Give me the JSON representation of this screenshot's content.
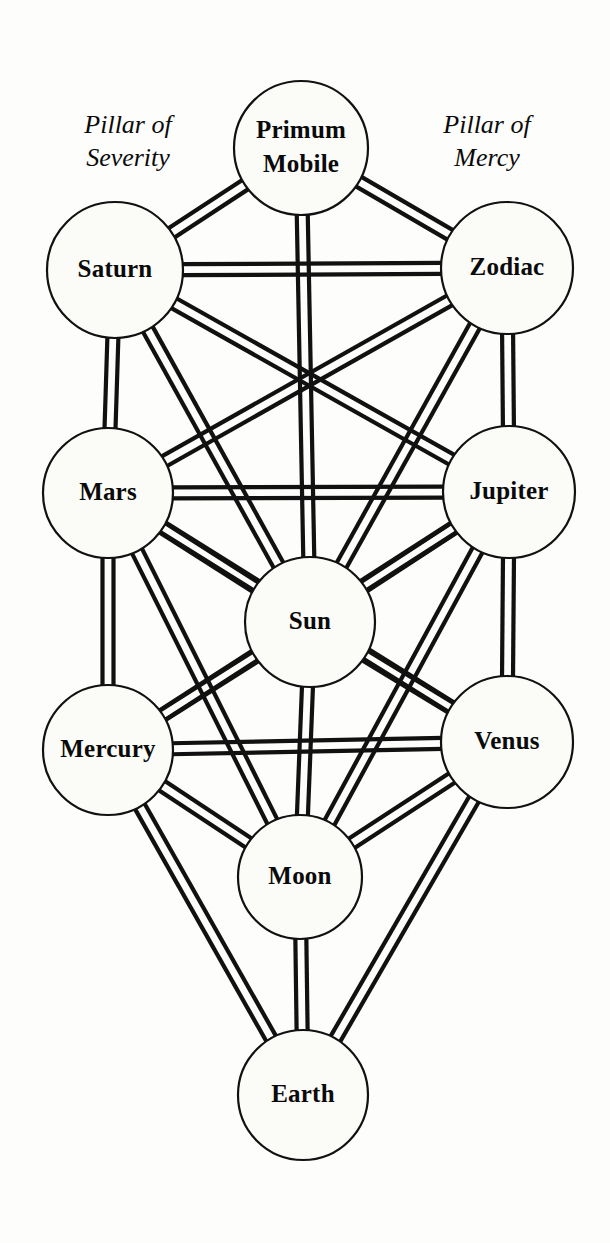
{
  "diagram": {
    "type": "network-diagram",
    "colors": {
      "background": "#fdfdfb",
      "line": "#111111",
      "node_fill": "#fbfbf8",
      "text": "#0a0a0a"
    },
    "pillars": [
      {
        "id": "pillar-severity",
        "label_line1": "Pillar of",
        "label_line2": "Severity",
        "side": "left",
        "x": 128,
        "y": 133
      },
      {
        "id": "pillar-mercy",
        "label_line1": "Pillar of",
        "label_line2": "Mercy",
        "side": "right",
        "x": 487,
        "y": 133
      }
    ],
    "nodes": [
      {
        "id": "primum-mobile",
        "label": "Primum Mobile",
        "line1": "Primum",
        "line2": "Mobile",
        "cx": 301,
        "cy": 148,
        "r": 67,
        "column": "middle",
        "row": 0
      },
      {
        "id": "saturn",
        "label": "Saturn",
        "line1": "Saturn",
        "line2": "",
        "cx": 115,
        "cy": 270,
        "r": 68,
        "column": "left",
        "row": 1
      },
      {
        "id": "zodiac",
        "label": "Zodiac",
        "line1": "Zodiac",
        "line2": "",
        "cx": 507,
        "cy": 268,
        "r": 66,
        "column": "right",
        "row": 1
      },
      {
        "id": "mars",
        "label": "Mars",
        "line1": "Mars",
        "line2": "",
        "cx": 108,
        "cy": 493,
        "r": 65,
        "column": "left",
        "row": 2
      },
      {
        "id": "jupiter",
        "label": "Jupiter",
        "line1": "Jupiter",
        "line2": "",
        "cx": 509,
        "cy": 492,
        "r": 66,
        "column": "right",
        "row": 2
      },
      {
        "id": "sun",
        "label": "Sun",
        "line1": "Sun",
        "line2": "",
        "cx": 310,
        "cy": 622,
        "r": 65,
        "column": "middle",
        "row": 3
      },
      {
        "id": "mercury",
        "label": "Mercury",
        "line1": "Mercury",
        "line2": "",
        "cx": 108,
        "cy": 750,
        "r": 65,
        "column": "left",
        "row": 4
      },
      {
        "id": "venus",
        "label": "Venus",
        "line1": "Venus",
        "line2": "",
        "cx": 507,
        "cy": 742,
        "r": 66,
        "column": "right",
        "row": 4
      },
      {
        "id": "moon",
        "label": "Moon",
        "line1": "Moon",
        "line2": "",
        "cx": 300,
        "cy": 877,
        "r": 62,
        "column": "middle",
        "row": 5
      },
      {
        "id": "earth",
        "label": "Earth",
        "line1": "Earth",
        "line2": "",
        "cx": 303,
        "cy": 1095,
        "r": 65,
        "column": "middle",
        "row": 6
      }
    ],
    "edges": [
      {
        "from": "primum-mobile",
        "to": "saturn"
      },
      {
        "from": "primum-mobile",
        "to": "zodiac"
      },
      {
        "from": "primum-mobile",
        "to": "sun"
      },
      {
        "from": "saturn",
        "to": "zodiac"
      },
      {
        "from": "saturn",
        "to": "mars"
      },
      {
        "from": "saturn",
        "to": "sun"
      },
      {
        "from": "saturn",
        "to": "jupiter"
      },
      {
        "from": "zodiac",
        "to": "jupiter"
      },
      {
        "from": "zodiac",
        "to": "sun"
      },
      {
        "from": "zodiac",
        "to": "mars"
      },
      {
        "from": "mars",
        "to": "jupiter"
      },
      {
        "from": "mars",
        "to": "sun"
      },
      {
        "from": "mars",
        "to": "mercury"
      },
      {
        "from": "mars",
        "to": "moon"
      },
      {
        "from": "mars",
        "to": "venus"
      },
      {
        "from": "jupiter",
        "to": "sun"
      },
      {
        "from": "jupiter",
        "to": "venus"
      },
      {
        "from": "jupiter",
        "to": "mercury"
      },
      {
        "from": "jupiter",
        "to": "moon"
      },
      {
        "from": "sun",
        "to": "mercury"
      },
      {
        "from": "sun",
        "to": "venus"
      },
      {
        "from": "sun",
        "to": "moon"
      },
      {
        "from": "mercury",
        "to": "venus"
      },
      {
        "from": "mercury",
        "to": "moon"
      },
      {
        "from": "mercury",
        "to": "earth"
      },
      {
        "from": "venus",
        "to": "moon"
      },
      {
        "from": "venus",
        "to": "earth"
      },
      {
        "from": "moon",
        "to": "earth"
      }
    ],
    "edge_style": {
      "double_line_gap": 11,
      "stroke_width": 4.2
    }
  }
}
